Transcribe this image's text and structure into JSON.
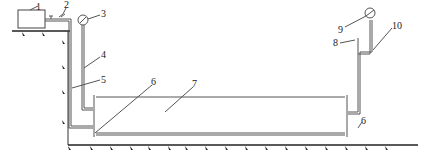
{
  "diagram": {
    "type": "schematic",
    "labels": [
      {
        "id": "1",
        "text": "1",
        "x": 36,
        "y": 2
      },
      {
        "id": "2",
        "text": "2",
        "x": 64,
        "y": 14
      },
      {
        "id": "3",
        "text": "3",
        "x": 100,
        "y": 14
      },
      {
        "id": "4",
        "text": "4",
        "x": 102,
        "y": 55
      },
      {
        "id": "5",
        "text": "5",
        "x": 102,
        "y": 77
      },
      {
        "id": "6a",
        "text": "6",
        "x": 152,
        "y": 80
      },
      {
        "id": "7",
        "text": "7",
        "x": 192,
        "y": 80
      },
      {
        "id": "8",
        "text": "8",
        "x": 333,
        "y": 38
      },
      {
        "id": "9",
        "text": "9",
        "x": 337,
        "y": 25
      },
      {
        "id": "10",
        "text": "10",
        "x": 392,
        "y": 22
      },
      {
        "id": "6b",
        "text": "6",
        "x": 360,
        "y": 117
      }
    ],
    "colors": {
      "line": "#555555",
      "ground": "#222222",
      "text": "#222222"
    }
  }
}
